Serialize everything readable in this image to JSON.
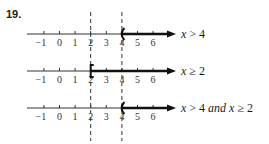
{
  "problem_number": "19.",
  "number_lines": [
    {
      "label": "x > 4",
      "label_parts": [
        {
          "text": "x",
          "italic": true
        },
        {
          "text": " > 4",
          "italic": false
        }
      ],
      "ticks": [
        "−1",
        "0",
        "1",
        "2",
        "3",
        "4",
        "5",
        "6"
      ],
      "endpoint": 4,
      "endpoint_type": "open",
      "endpoint_symbol": "(",
      "direction": "right"
    },
    {
      "label": "x ≥ 2",
      "label_parts": [
        {
          "text": "x",
          "italic": true
        },
        {
          "text": " ≥ 2",
          "italic": false
        }
      ],
      "ticks": [
        "−1",
        "0",
        "1",
        "2",
        "3",
        "4",
        "5",
        "6"
      ],
      "endpoint": 2,
      "endpoint_type": "closed",
      "endpoint_symbol": "[",
      "direction": "right"
    },
    {
      "label": "x > 4 and x ≥ 2",
      "label_parts": [
        {
          "text": "x",
          "italic": true
        },
        {
          "text": " > 4 ",
          "italic": false
        },
        {
          "text": "and",
          "italic": true
        },
        {
          "text": " ",
          "italic": false
        },
        {
          "text": "x",
          "italic": true
        },
        {
          "text": " ≥ 2",
          "italic": false
        }
      ],
      "ticks": [
        "−1",
        "0",
        "1",
        "2",
        "3",
        "4",
        "5",
        "6"
      ],
      "endpoint": 4,
      "endpoint_type": "open",
      "endpoint_symbol": "(",
      "direction": "right"
    }
  ],
  "guide_lines": [
    2,
    4
  ],
  "colors": {
    "line": "#333333",
    "ray": "#111111",
    "dash": "#333333"
  }
}
